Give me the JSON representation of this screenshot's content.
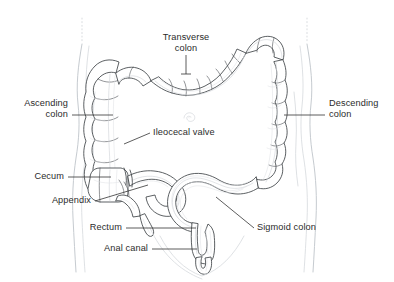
{
  "figure": {
    "background_color": "#ffffff",
    "ink_color": "#3a3a3a",
    "light_ink_color": "#c9cdd2",
    "text_color": "#2b2b2b",
    "leader_color": "#333333"
  },
  "labels": {
    "transverse_colon": "Transverse\ncolon",
    "ascending_colon": "Ascending\ncolon",
    "descending_colon": "Descending\ncolon",
    "ileocecal_valve": "Ileocecal valve",
    "cecum": "Cecum",
    "appendix": "Appendix",
    "rectum": "Rectum",
    "anal_canal": "Anal canal",
    "sigmoid_colon": "Sigmoid colon"
  },
  "parts": [
    {
      "id": "transverse-colon",
      "label": "Transverse colon",
      "side": "top-center"
    },
    {
      "id": "ascending-colon",
      "label": "Ascending colon",
      "side": "left"
    },
    {
      "id": "descending-colon",
      "label": "Descending colon",
      "side": "right"
    },
    {
      "id": "ileocecal-valve",
      "label": "Ileocecal valve",
      "side": "center"
    },
    {
      "id": "cecum",
      "label": "Cecum",
      "side": "left"
    },
    {
      "id": "appendix",
      "label": "Appendix",
      "side": "left"
    },
    {
      "id": "rectum",
      "label": "Rectum",
      "side": "left"
    },
    {
      "id": "anal-canal",
      "label": "Anal canal",
      "side": "left"
    },
    {
      "id": "sigmoid-colon",
      "label": "Sigmoid colon",
      "side": "right"
    }
  ]
}
